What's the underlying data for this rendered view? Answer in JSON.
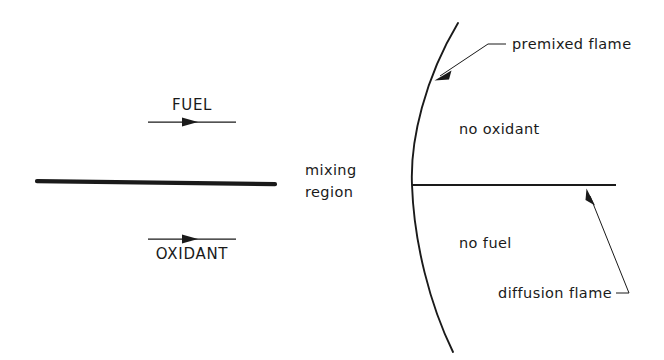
{
  "figure": {
    "width": 664,
    "height": 360,
    "background_color": "#ffffff",
    "ink_color": "#1a1a1a"
  },
  "left_panel": {
    "name": "splitter-plate-mixing-layer",
    "fuel_label": "FUEL",
    "oxidant_label": "OXIDANT",
    "mixing_region_line1": "mixing",
    "mixing_region_line2": "region",
    "fuel_arrow": {
      "direction": "right",
      "x_start": 148,
      "x_end": 236,
      "y": 122,
      "head_x": 196
    },
    "oxidant_arrow": {
      "direction": "right",
      "x_start": 148,
      "x_end": 236,
      "y": 239,
      "head_x": 196
    },
    "plate": {
      "x_start": 37,
      "x_end": 275,
      "y_start": 181,
      "y_end": 184
    }
  },
  "right_panel": {
    "name": "flame-structure",
    "premixed_flame_label": "premixed  flame",
    "no_oxidant_label": "no  oxidant",
    "no_fuel_label": "no  fuel",
    "diffusion_flame_label": "diffusion flame",
    "premixed_arc": {
      "top_x": 458,
      "top_y": 23,
      "vertex_x": 412,
      "vertex_y": 185,
      "bottom_x": 453,
      "bottom_y": 352
    },
    "diffusion_line": {
      "x_start": 412,
      "x_end": 616,
      "y": 185
    },
    "premixed_leader": {
      "tip_x": 436,
      "tip_y": 79,
      "elbow_x": 488,
      "elbow_y": 44,
      "tail_x": 506,
      "tail_y": 44
    },
    "diffusion_leader": {
      "tip_x": 587,
      "tip_y": 190,
      "elbow_x": 629,
      "elbow_y": 293,
      "tail_x": 616,
      "tail_y": 293
    }
  }
}
